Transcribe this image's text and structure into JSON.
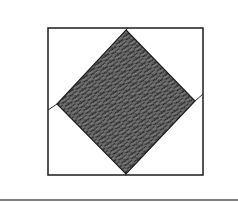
{
  "diagram": {
    "colors": {
      "background": "#ffffff",
      "stroke": "#2a2a2a",
      "fabric_fill": "#6b6b6b",
      "fabric_highlight": "#8a8a8a",
      "stitch_outline": "#1e1e1e",
      "rule": "#555555"
    },
    "outer_square": {
      "x": 48,
      "y": 28,
      "width": 155,
      "height": 147
    },
    "diamond": {
      "label": "center-diamond",
      "pattern": "knit-stitch",
      "vertices": {
        "top": [
          126,
          30
        ],
        "right": [
          195,
          101
        ],
        "bottom": [
          126,
          174
        ],
        "left": [
          57,
          104
        ]
      }
    },
    "connectors": [
      {
        "name": "top",
        "from": [
          126,
          30
        ],
        "to": [
          128,
          28
        ]
      },
      {
        "name": "right",
        "from": [
          195,
          101
        ],
        "to": [
          203,
          94
        ]
      },
      {
        "name": "bottom",
        "from": [
          126,
          174
        ],
        "to": [
          125,
          175
        ]
      },
      {
        "name": "left",
        "from": [
          57,
          104
        ],
        "to": [
          48,
          110
        ]
      }
    ],
    "rule": {
      "y": 200,
      "x1": 0,
      "x2": 238
    }
  }
}
